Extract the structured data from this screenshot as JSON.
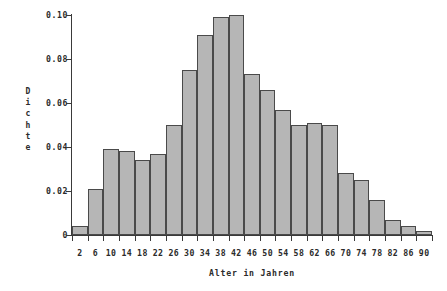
{
  "chart_data": {
    "type": "bar",
    "title": "",
    "subtitle": "",
    "xlabel": "Alter in Jahren",
    "ylabel": "Dichte",
    "ylabel_letters": [
      "D",
      "i",
      "c",
      "h",
      "t",
      "e"
    ],
    "categories": [
      "2",
      "6",
      "10",
      "14",
      "18",
      "22",
      "26",
      "30",
      "34",
      "38",
      "42",
      "46",
      "50",
      "54",
      "58",
      "62",
      "66",
      "70",
      "74",
      "78",
      "82",
      "86",
      "90"
    ],
    "values": [
      0.004,
      0.021,
      0.039,
      0.038,
      0.034,
      0.037,
      0.05,
      0.075,
      0.091,
      0.099,
      0.1,
      0.073,
      0.066,
      0.057,
      0.05,
      0.051,
      0.05,
      0.028,
      0.025,
      0.016,
      0.007,
      0.004,
      0.002
    ],
    "bin_width": 4,
    "bin_edges": [
      0,
      4,
      8,
      12,
      16,
      20,
      24,
      28,
      32,
      36,
      40,
      44,
      48,
      52,
      56,
      60,
      64,
      68,
      72,
      76,
      80,
      84,
      88,
      92
    ],
    "xlim": [
      0,
      92
    ],
    "ylim": [
      0,
      0.1
    ],
    "ytick_labels": [
      "0",
      "0.02",
      "0.04",
      "0.06",
      "0.08",
      "0.10"
    ],
    "ytick_values": [
      0,
      0.02,
      0.04,
      0.06,
      0.08,
      0.1
    ],
    "xtick_labels": [
      "2",
      "6",
      "10",
      "14",
      "18",
      "22",
      "26",
      "30",
      "34",
      "38",
      "42",
      "46",
      "50",
      "54",
      "58",
      "62",
      "66",
      "70",
      "74",
      "78",
      "82",
      "86",
      "90"
    ],
    "grid": false,
    "legend": false,
    "legend_position": "none",
    "colors": {
      "bar_fill": "#b6b6b6",
      "bar_edge": "#4a4a4a",
      "axis": "#3a3a3a",
      "text": "#2b2b2b",
      "background": "#ffffff"
    }
  }
}
